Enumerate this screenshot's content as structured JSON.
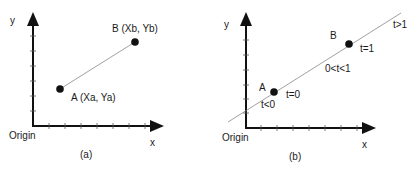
{
  "panel_a": {
    "caption": "(a)",
    "y_axis_label": "y",
    "x_axis_label": "x",
    "origin_label": "Origin",
    "point_a_label": "A (Xa, Ya)",
    "point_b_label": "B (Xb, Yb)"
  },
  "panel_b": {
    "caption": "(b)",
    "y_axis_label": "y",
    "x_axis_label": "x",
    "origin_label": "Origin",
    "point_a_label": "A",
    "point_b_label": "B",
    "t_at_a": "t=0",
    "t_at_b": "t=1",
    "t_before_a": "t<0",
    "t_between": "0<t<1",
    "t_after_b": "t>1"
  },
  "colors": {
    "ink": "#111111",
    "line": "#888888"
  }
}
